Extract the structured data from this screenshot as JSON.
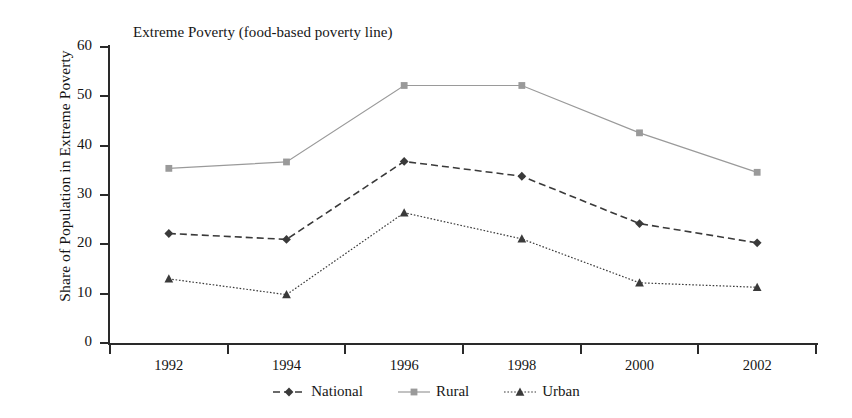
{
  "chart_data": {
    "type": "line",
    "title": "Extreme Poverty (food-based poverty line)",
    "xlabel": "",
    "ylabel": "Share of Population in Extreme Poverty",
    "categories": [
      "1992",
      "1994",
      "1996",
      "1998",
      "2000",
      "2002"
    ],
    "ylim": [
      0,
      60
    ],
    "yticks": [
      0,
      10,
      20,
      30,
      40,
      50,
      60
    ],
    "grid": false,
    "legend_position": "bottom",
    "series": [
      {
        "name": "National",
        "values": [
          22.2,
          21.0,
          36.8,
          33.8,
          24.2,
          20.3
        ],
        "marker": "diamond",
        "dash": "dashed",
        "color": "#3a3a3a"
      },
      {
        "name": "Rural",
        "values": [
          35.4,
          36.7,
          52.2,
          52.2,
          42.6,
          34.6
        ],
        "marker": "square",
        "dash": "solid",
        "color": "#9a9a9a"
      },
      {
        "name": "Urban",
        "values": [
          13.0,
          9.8,
          26.4,
          21.1,
          12.2,
          11.3
        ],
        "marker": "triangle",
        "dash": "dotted",
        "color": "#3a3a3a"
      }
    ]
  },
  "legend": {
    "items": [
      {
        "label": "National"
      },
      {
        "label": "Rural"
      },
      {
        "label": "Urban"
      }
    ]
  },
  "colors": {
    "axis": "#2a2a2a",
    "text": "#161616",
    "national": "#3a3a3a",
    "rural": "#9a9a9a",
    "urban": "#3a3a3a",
    "background": "#ffffff"
  }
}
